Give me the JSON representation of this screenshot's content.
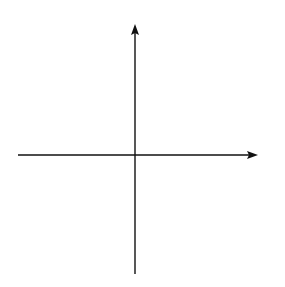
{
  "chart_data": {
    "type": "line",
    "title": "",
    "xlabel": "x",
    "ylabel": "y",
    "x_tick_labels": [
      "-1",
      "0",
      "1"
    ],
    "grid": true,
    "grid_spacing_units": 0.5,
    "xlim": [
      -4.0,
      3.5
    ],
    "ylim": [
      -3.6,
      4.1
    ],
    "series": [
      {
        "name": "f(x)",
        "x": [
          -2.35,
          -2.2,
          -2.0,
          -1.7,
          -1.4,
          -1.0,
          -0.6,
          -0.3,
          -0.1,
          0.0,
          0.1,
          0.3,
          0.6,
          1.0,
          1.4,
          1.8,
          2.2,
          2.55,
          2.8
        ],
        "y": [
          -1.9,
          -1.4,
          -0.9,
          -0.45,
          -0.15,
          0.0,
          0.15,
          0.4,
          0.75,
          1.2,
          1.75,
          2.1,
          2.4,
          2.6,
          2.4,
          1.9,
          1.1,
          0.0,
          -0.9
        ]
      }
    ],
    "features": {
      "peak": [
        1,
        2.6
      ],
      "inflection_flat": [
        -1,
        0
      ],
      "vertical_tangent": [
        0,
        1.2
      ],
      "x_intercepts": [
        -1,
        2.55
      ],
      "endpoints": [
        [
          -2.35,
          -1.9
        ],
        [
          2.8,
          -0.9
        ]
      ]
    }
  },
  "labels": {
    "x_axis": "x",
    "y_axis": "y",
    "tick_neg1": "−1",
    "tick_0": "0",
    "tick_1": "1"
  }
}
